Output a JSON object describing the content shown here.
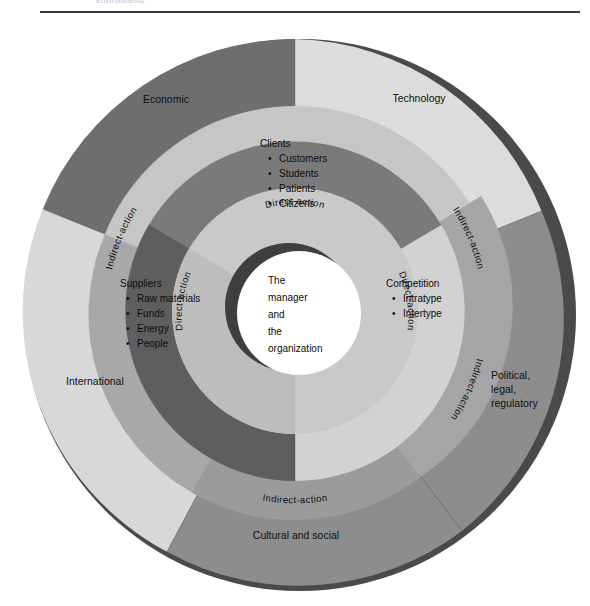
{
  "page": {
    "running_head": "Environments"
  },
  "diagram": {
    "center": {
      "lines": [
        "The",
        "manager",
        "and",
        "the",
        "organization"
      ]
    },
    "direct_action_ring": {
      "label": "Direct-action",
      "instances": [
        "Direct-action",
        "Direct-action",
        "Direct-action"
      ]
    },
    "indirect_action_ring": {
      "label": "Indirect-action",
      "instances": [
        "Indirect-action",
        "Indirect-action",
        "Indirect-action",
        "Indirect-action"
      ]
    },
    "inner_segments": [
      {
        "name": "clients",
        "heading": "Clients",
        "items": [
          "Customers",
          "Students",
          "Patients",
          "Citizens"
        ],
        "color": "#7a7a7a"
      },
      {
        "name": "suppliers",
        "heading": "Suppliers",
        "items": [
          "Raw materials",
          "Funds",
          "Energy",
          "People"
        ],
        "color": "#5e5e5e"
      },
      {
        "name": "competition",
        "heading": "Competition",
        "items": [
          "Intratype",
          "Intertype"
        ],
        "color": "#d2d2d2"
      }
    ],
    "outer_segments": [
      {
        "name": "economic",
        "label": "Economic",
        "color": "#6e6e6e"
      },
      {
        "name": "technology",
        "label": "Technology",
        "color": "#dcdcdc"
      },
      {
        "name": "political-legal-regulatory",
        "label_lines": [
          "Political,",
          "legal,",
          "regulatory"
        ],
        "color": "#8d8d8d"
      },
      {
        "name": "cultural-and-social",
        "label": "Cultural and social",
        "color": "#8d8d8d"
      },
      {
        "name": "international",
        "label": "International",
        "color": "#d8d8d8"
      }
    ],
    "colors": {
      "outer_dark": "#6e6e6e",
      "outer_light": "#dcdcdc",
      "outer_medium": "#8d8d8d",
      "band_light": "#c6c6c6",
      "band_mid": "#9b9b9b",
      "inner_dark": "#5e5e5e",
      "inner_mid": "#7a7a7a",
      "inner_light": "#d2d2d2",
      "direct_band": "#c9c9c9",
      "center_fill": "#ffffff",
      "shadow": "#4a4a4a",
      "rule": "#3a3a42"
    }
  }
}
